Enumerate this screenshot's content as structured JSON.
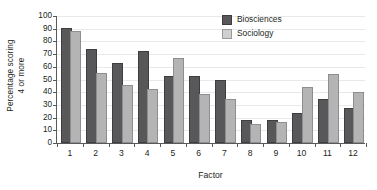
{
  "chart_data": {
    "type": "bar",
    "title": "",
    "xlabel": "Factor",
    "ylabel": "Percentage scoring 4 or more",
    "ylabel_line1": "Percentage scoring",
    "ylabel_line2": "4 or more",
    "categories": [
      "1",
      "2",
      "3",
      "4",
      "5",
      "6",
      "7",
      "8",
      "9",
      "10",
      "11",
      "12"
    ],
    "ylim": [
      0,
      100
    ],
    "ytick_labels": [
      "0",
      "10",
      "20",
      "30",
      "40",
      "50",
      "60",
      "70",
      "80",
      "90",
      "100"
    ],
    "ytick_values": [
      0,
      10,
      20,
      30,
      40,
      50,
      60,
      70,
      80,
      90,
      100
    ],
    "grid": true,
    "grid_axis": "y",
    "legend_position": "top-right",
    "series": [
      {
        "name": "Biosciences",
        "color": "#58585a",
        "values": [
          88,
          72,
          61,
          70,
          51,
          51,
          48,
          16.5,
          16.5,
          21.5,
          32.5,
          25.5
        ]
      },
      {
        "name": "Sociology",
        "color": "#b4b4b4",
        "values": [
          86,
          53,
          44,
          40.5,
          65,
          37,
          32.5,
          13,
          14.5,
          42.5,
          52,
          38
        ]
      }
    ]
  },
  "legend": {
    "items": [
      {
        "label": "Biosciences"
      },
      {
        "label": "Sociology"
      }
    ]
  },
  "colors": {
    "series_biosciences": "#58585a",
    "series_sociology": "#b4b4b4",
    "axis": "#58595b",
    "gridline": "#e9e9ea",
    "text": "#231f20",
    "background": "#ffffff"
  }
}
